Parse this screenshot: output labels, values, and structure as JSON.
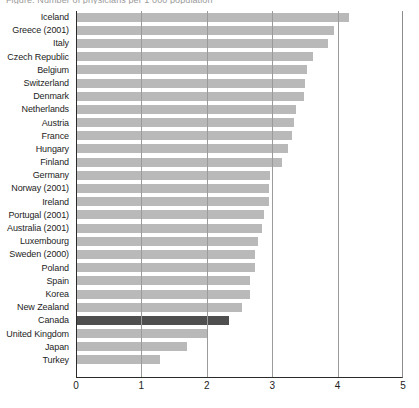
{
  "caption": "Figure: Number of physicians per 1 000 population",
  "chart_data": {
    "type": "bar",
    "orientation": "horizontal",
    "title": "",
    "xlabel": "",
    "ylabel": "",
    "xlim": [
      0,
      5
    ],
    "xticks": [
      0,
      1,
      2,
      3,
      4,
      5
    ],
    "xtick_labels": [
      "0",
      "1",
      "2",
      "3",
      "4",
      "5"
    ],
    "grid": "vertical",
    "legend": "none",
    "highlight_category": "Canada",
    "colors": {
      "bar": "#b9b9b9",
      "highlight": "#4f4f4f",
      "axis": "#2b2b2b",
      "grid": "#9b9b9b",
      "text": "#1d1d1d"
    },
    "categories": [
      "Iceland",
      "Greece (2001)",
      "Italy",
      "Czech Republic",
      "Belgium",
      "Switzerland",
      "Denmark",
      "Netherlands",
      "Austria",
      "France",
      "Hungary",
      "Finland",
      "Germany",
      "Norway (2001)",
      "Ireland",
      "Portugal (2001)",
      "Australia (2001)",
      "Luxembourg",
      "Sweden (2000)",
      "Poland",
      "Spain",
      "Korea",
      "New Zealand",
      "Canada",
      "United Kingdom",
      "Japan",
      "Turkey"
    ],
    "values": [
      4.17,
      3.95,
      3.85,
      3.62,
      3.53,
      3.5,
      3.48,
      3.37,
      3.34,
      3.31,
      3.24,
      3.15,
      2.96,
      2.95,
      2.95,
      2.88,
      2.84,
      2.78,
      2.73,
      2.73,
      2.66,
      2.66,
      2.54,
      2.34,
      2.01,
      1.7,
      1.29
    ]
  }
}
